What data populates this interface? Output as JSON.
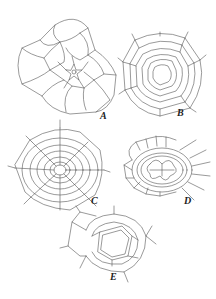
{
  "figure": {
    "panels": [
      {
        "id": "A",
        "label": "A",
        "description": "polygonal epidermal cells radiating around small star-shaped central pore"
      },
      {
        "id": "B",
        "label": "B",
        "description": "concentric rings of cells around central opening"
      },
      {
        "id": "C",
        "label": "C",
        "description": "concentric rings with radial walls, web-like arrangement"
      },
      {
        "id": "D",
        "label": "D",
        "description": "oval guard-cell ring with lobed central structure, surrounded by small cells"
      },
      {
        "id": "E",
        "label": "E",
        "description": "pentagonal double-walled pore surrounded by irregular cells"
      }
    ],
    "colors": {
      "line": "#555555",
      "label": "#222222",
      "background": "#ffffff"
    }
  }
}
